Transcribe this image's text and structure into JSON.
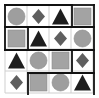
{
  "puzzle": {
    "rows": 4,
    "cols": 4,
    "origin": [
      5,
      5
    ],
    "cell_size": 22,
    "colors": {
      "circle": "#9e9e9e",
      "square": "#a3a3a3",
      "diamond": "#5f5f5f",
      "triangle": "#1e1e1e",
      "grid_thin": "#cfcfcf",
      "grid_thick": "#111111"
    },
    "grid": [
      [
        "circle",
        "diamond",
        "triangle",
        "square"
      ],
      [
        "square",
        "triangle",
        "diamond",
        "circle"
      ],
      [
        "triangle",
        "circle",
        "square",
        "diamond"
      ],
      [
        "diamond",
        "square",
        "circle",
        "triangle"
      ]
    ],
    "thick_segments": [
      [
        5,
        5,
        72,
        5
      ],
      [
        72,
        5,
        94,
        5
      ],
      [
        5,
        5,
        5,
        50
      ],
      [
        72,
        5,
        72,
        27
      ],
      [
        94,
        5,
        94,
        94
      ],
      [
        5,
        27,
        94,
        27
      ],
      [
        28,
        27,
        28,
        50
      ],
      [
        5,
        50,
        94,
        50
      ],
      [
        72,
        50,
        72,
        73
      ],
      [
        28,
        73,
        94,
        73
      ],
      [
        28,
        73,
        28,
        94
      ]
    ]
  }
}
